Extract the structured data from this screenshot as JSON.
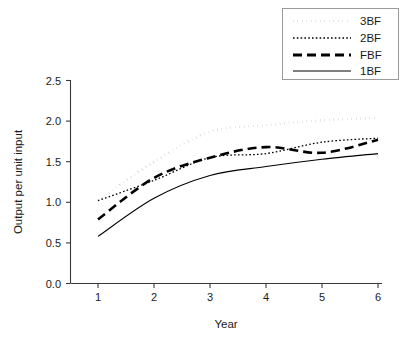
{
  "chart_data": {
    "type": "line",
    "title": "",
    "xlabel": "Year",
    "ylabel": "Output per unit input",
    "x": [
      1,
      2,
      3,
      4,
      5,
      6
    ],
    "xlim": [
      1,
      6
    ],
    "ylim": [
      0.0,
      2.5
    ],
    "xticks": [
      "1",
      "2",
      "3",
      "4",
      "5",
      "6"
    ],
    "yticks": [
      "0.0",
      "0.5",
      "1.0",
      "1.5",
      "2.0",
      "2.5"
    ],
    "grid": false,
    "legend_position": "top-right",
    "series": [
      {
        "name": "3BF",
        "style": "thick-dotted",
        "color": "#000000",
        "values": [
          1.02,
          1.5,
          1.87,
          1.95,
          2.01,
          2.04
        ]
      },
      {
        "name": "2BF",
        "style": "thin-dotted",
        "color": "#000000",
        "values": [
          1.02,
          1.27,
          1.55,
          1.6,
          1.74,
          1.79
        ]
      },
      {
        "name": "FBF",
        "style": "thick-dashed",
        "color": "#000000",
        "values": [
          0.79,
          1.3,
          1.55,
          1.68,
          1.61,
          1.77
        ]
      },
      {
        "name": "1BF",
        "style": "thin-solid",
        "color": "#000000",
        "values": [
          0.58,
          1.05,
          1.33,
          1.44,
          1.53,
          1.6
        ]
      }
    ]
  },
  "axes": {
    "x_title": "Year",
    "y_title": "Output per unit input",
    "x_tick_labels": [
      "1",
      "2",
      "3",
      "4",
      "5",
      "6"
    ],
    "y_tick_labels": [
      "0.0",
      "0.5",
      "1.0",
      "1.5",
      "2.0",
      "2.5"
    ]
  },
  "legend": {
    "entries": [
      {
        "label": "3BF"
      },
      {
        "label": "2BF"
      },
      {
        "label": "FBF"
      },
      {
        "label": "1BF"
      }
    ]
  }
}
